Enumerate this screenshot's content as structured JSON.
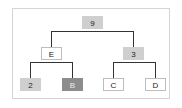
{
  "diagram": {
    "type": "tree",
    "nodes": [
      {
        "id": "root",
        "label": "9",
        "style": "gray"
      },
      {
        "id": "left",
        "label": "E",
        "style": "white"
      },
      {
        "id": "right",
        "label": "3",
        "style": "gray"
      },
      {
        "id": "left-left",
        "label": "2",
        "style": "gray"
      },
      {
        "id": "left-right",
        "label": "B",
        "style": "dark"
      },
      {
        "id": "right-left",
        "label": "C",
        "style": "white"
      },
      {
        "id": "right-right",
        "label": "D",
        "style": "white"
      }
    ],
    "edges": [
      [
        "root",
        "left"
      ],
      [
        "root",
        "right"
      ],
      [
        "left",
        "left-left"
      ],
      [
        "left",
        "left-right"
      ],
      [
        "right",
        "right-left"
      ],
      [
        "right",
        "right-right"
      ]
    ],
    "colors": {
      "gray": "#cfcfcf",
      "dark": "#8c8c8c",
      "white": "#ffffff",
      "line": "#333333",
      "border": "#d4d4d4"
    }
  }
}
